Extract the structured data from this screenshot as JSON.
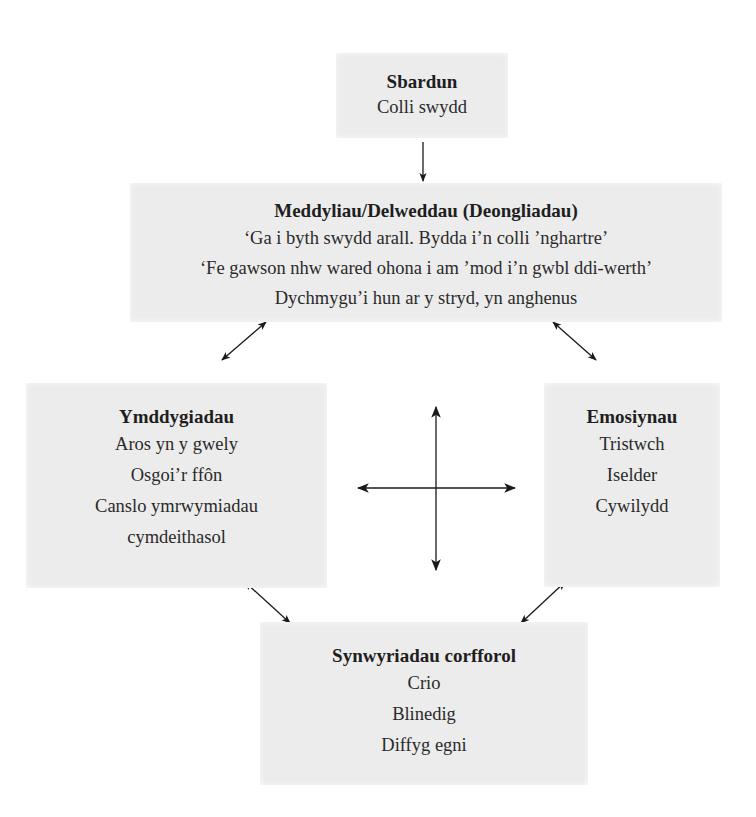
{
  "diagram": {
    "trigger": {
      "title": "Sbardun",
      "lines": [
        "Colli swydd"
      ]
    },
    "thoughts": {
      "title": "Meddyliau/Delweddau (Deongliadau)",
      "lines": [
        "‘Ga i byth swydd arall. Bydda i’n colli ’nghartre’",
        "‘Fe gawson nhw wared ohona i am ’mod i’n gwbl ddi-werth’",
        "Dychmygu’i hun ar y stryd, yn anghenus"
      ]
    },
    "behaviours": {
      "title": "Ymddygiadau",
      "lines": [
        "Aros yn y gwely",
        "Osgoi’r ffôn",
        "Canslo ymrwymiadau",
        "cymdeithasol"
      ]
    },
    "emotions": {
      "title": "Emosiynau",
      "lines": [
        "Tristwch",
        "Iselder",
        "Cywilydd"
      ]
    },
    "physical": {
      "title": "Synwyriadau corfforol",
      "lines": [
        "Crio",
        "Blinedig",
        "Diffyg egni"
      ]
    },
    "connectors": [
      {
        "from": "trigger",
        "to": "thoughts",
        "type": "one-way"
      },
      {
        "from": "thoughts",
        "to": "behaviours",
        "type": "two-way"
      },
      {
        "from": "thoughts",
        "to": "emotions",
        "type": "two-way"
      },
      {
        "from": "behaviours",
        "to": "physical",
        "type": "two-way"
      },
      {
        "from": "emotions",
        "to": "physical",
        "type": "two-way"
      },
      {
        "from": "center",
        "to": "all",
        "type": "four-way-cross"
      }
    ],
    "colors": {
      "box_fill": "#ececec",
      "text": "#2a2a2a",
      "arrow": "#1a1a1a",
      "background": "#ffffff"
    }
  }
}
